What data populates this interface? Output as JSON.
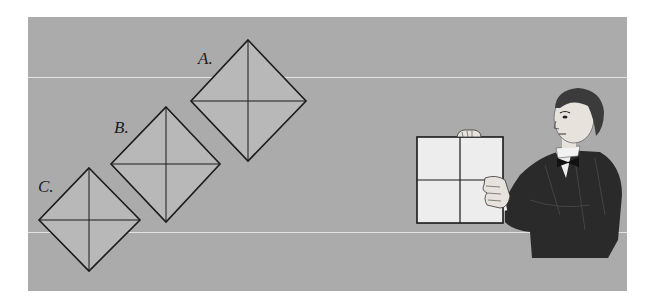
{
  "diagram": {
    "colors": {
      "background": "#ffffff",
      "panel": "#ababab",
      "guide_line": "#e4e4e4",
      "diamond_fill": "#b8b8b8",
      "stroke": "#1a1a1a",
      "held_square_fill": "#ededed",
      "jacket": "#2a2a2a",
      "skin": "#e8e2dc"
    },
    "diamonds": [
      {
        "label": "A.",
        "top": [
          248,
          40
        ],
        "left": [
          191,
          101
        ],
        "right": [
          306,
          101
        ],
        "bottom": [
          248,
          161
        ]
      },
      {
        "label": "B.",
        "top": [
          166,
          107
        ],
        "left": [
          111,
          164
        ],
        "right": [
          220,
          164
        ],
        "bottom": [
          166,
          222
        ]
      },
      {
        "label": "C.",
        "top": [
          89,
          168
        ],
        "left": [
          39,
          220
        ],
        "right": [
          140,
          220
        ],
        "bottom": [
          89,
          271
        ]
      }
    ],
    "held_square": {
      "x": 417,
      "y": 137,
      "width": 86,
      "height": 86,
      "divisions": "2x2"
    },
    "figure": "man in dark suit and bow tie holding up a square divided into four quadrants"
  }
}
